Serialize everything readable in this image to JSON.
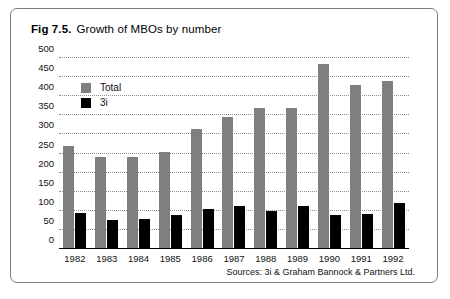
{
  "figure": {
    "number": "Fig 7.5.",
    "title": "Growth of MBOs by number",
    "source": "Sources: 3i & Graham Bannock & Partners Ltd."
  },
  "legend": {
    "position": "top-left-inside",
    "items": [
      {
        "label": "Total",
        "color": "#7f7f7f",
        "swatch": "total"
      },
      {
        "label": "3i",
        "color": "#000000",
        "swatch": "sub"
      }
    ]
  },
  "chart_data": {
    "type": "bar",
    "title": "Growth of MBOs by number",
    "xlabel": "",
    "ylabel": "",
    "ylim": [
      0,
      500
    ],
    "yticks": [
      500,
      450,
      400,
      350,
      300,
      250,
      200,
      150,
      100,
      50,
      0
    ],
    "grid": true,
    "categories": [
      "1982",
      "1983",
      "1984",
      "1985",
      "1986",
      "1987",
      "1988",
      "1989",
      "1990",
      "1991",
      "1992"
    ],
    "series": [
      {
        "name": "Total",
        "color": "#7f7f7f",
        "values": [
          270,
          240,
          240,
          255,
          315,
          345,
          370,
          370,
          485,
          430,
          440
        ]
      },
      {
        "name": "3i",
        "color": "#000000",
        "values": [
          95,
          75,
          78,
          90,
          105,
          112,
          100,
          112,
          90,
          92,
          120
        ]
      }
    ]
  }
}
